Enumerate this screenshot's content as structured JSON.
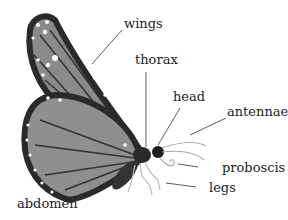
{
  "diagram": {
    "colors": {
      "wing_fill": "#8a8a8a",
      "wing_border": "#2a2a2a",
      "body": "#333333",
      "line": "#333333",
      "leg": "#bbbbbb"
    },
    "labels": {
      "wings": "wings",
      "thorax": "thorax",
      "head": "head",
      "antennae": "antennae",
      "proboscis": "proboscis",
      "legs": "legs",
      "abdomen": "abdomen"
    }
  }
}
